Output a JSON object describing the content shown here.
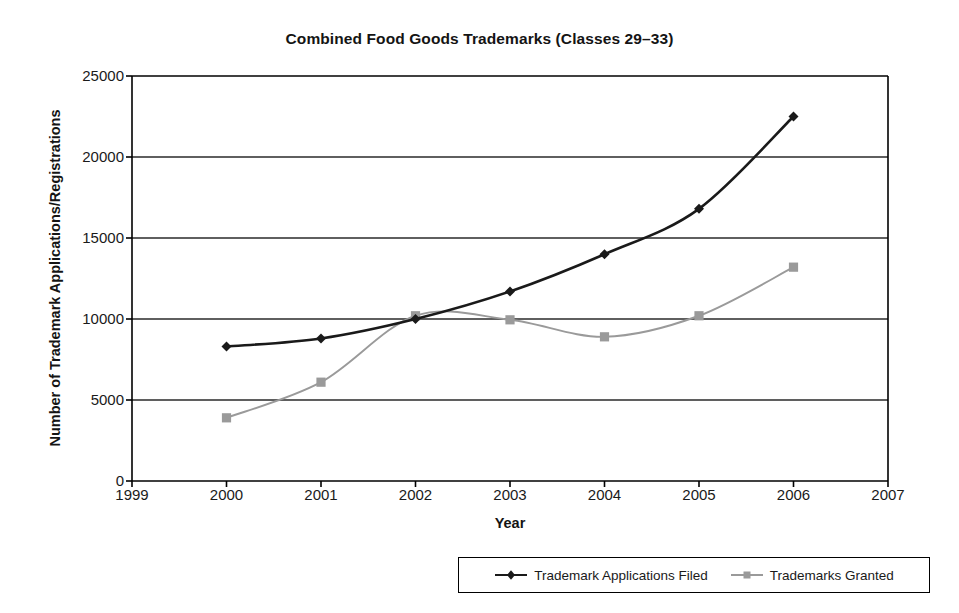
{
  "chart_data": {
    "type": "line",
    "title": "Combined Food Goods Trademarks (Classes 29–33)",
    "xlabel": "Year",
    "ylabel": "Number of Trademark Applications/Registrations",
    "x": [
      2000,
      2001,
      2002,
      2003,
      2004,
      2005,
      2006
    ],
    "xlim": [
      1999,
      2007
    ],
    "ylim": [
      0,
      25000
    ],
    "x_ticks": [
      "1999",
      "2000",
      "2001",
      "2002",
      "2003",
      "2004",
      "2005",
      "2006",
      "2007"
    ],
    "x_tick_values": [
      1999,
      2000,
      2001,
      2002,
      2003,
      2004,
      2005,
      2006,
      2007
    ],
    "y_ticks": [
      "0",
      "5000",
      "10000",
      "15000",
      "20000",
      "25000"
    ],
    "y_tick_values": [
      0,
      5000,
      10000,
      15000,
      20000,
      25000
    ],
    "grid": "horizontal",
    "smoothing": "spline",
    "legend_position": "bottom",
    "series": [
      {
        "name": "Trademark Applications Filed",
        "color": "#1a1a1a",
        "marker": "diamond",
        "values": [
          8300,
          8800,
          10000,
          11700,
          14000,
          16800,
          22500
        ]
      },
      {
        "name": "Trademarks Granted",
        "color": "#9a9a9a",
        "marker": "square",
        "values": [
          3900,
          6100,
          10200,
          9950,
          8900,
          10200,
          13200
        ]
      }
    ]
  },
  "legend": {
    "entries": [
      {
        "label": "Trademark Applications Filed"
      },
      {
        "label": "Trademarks Granted"
      }
    ]
  },
  "colors": {
    "series_filed": "#1a1a1a",
    "series_granted": "#9a9a9a",
    "axis": "#000000",
    "background": "#ffffff"
  }
}
